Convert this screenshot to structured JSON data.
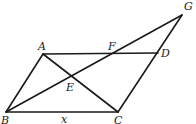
{
  "diagram": {
    "points": {
      "A": {
        "x": 43,
        "y": 54
      },
      "B": {
        "x": 6,
        "y": 112
      },
      "C": {
        "x": 118,
        "y": 112
      },
      "D": {
        "x": 158,
        "y": 53
      },
      "E": {
        "x": 72,
        "y": 76
      },
      "F": {
        "x": 113,
        "y": 53
      },
      "G": {
        "x": 182,
        "y": 15
      }
    },
    "segments": [
      [
        "A",
        "B"
      ],
      [
        "B",
        "C"
      ],
      [
        "C",
        "G"
      ],
      [
        "A",
        "D"
      ],
      [
        "A",
        "C"
      ],
      [
        "B",
        "G"
      ]
    ],
    "labels": {
      "A": "A",
      "B": "B",
      "C": "C",
      "D": "D",
      "E": "E",
      "F": "F",
      "G": "G",
      "side_BC": "x"
    }
  }
}
